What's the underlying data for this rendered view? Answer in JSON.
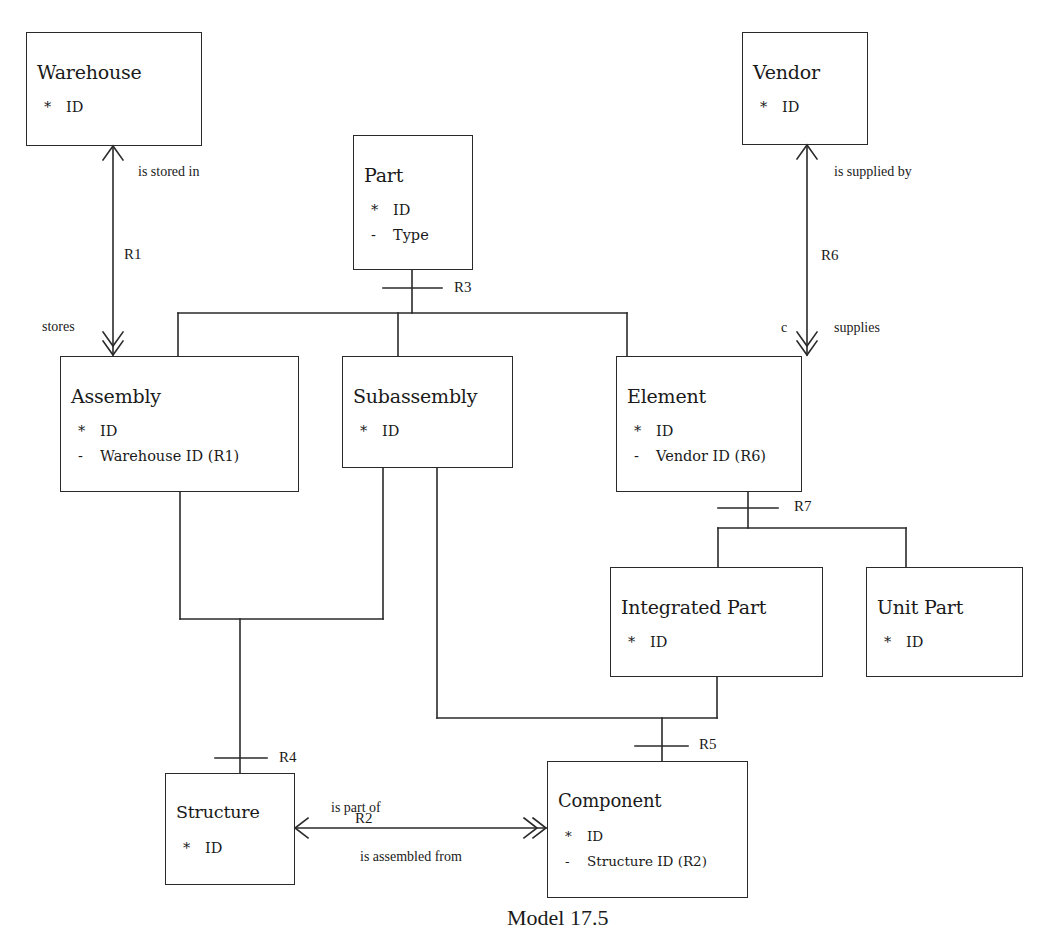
{
  "diagram": {
    "caption": "Model 17.5",
    "entities": {
      "warehouse": {
        "name": "Warehouse",
        "attrs": [
          {
            "mark": "*",
            "text": "ID"
          }
        ]
      },
      "part": {
        "name": "Part",
        "attrs": [
          {
            "mark": "*",
            "text": "ID"
          },
          {
            "mark": "-",
            "text": "Type"
          }
        ]
      },
      "vendor": {
        "name": "Vendor",
        "attrs": [
          {
            "mark": "*",
            "text": "ID"
          }
        ]
      },
      "assembly": {
        "name": "Assembly",
        "attrs": [
          {
            "mark": "*",
            "text": "ID"
          },
          {
            "mark": "-",
            "text": "Warehouse ID (R1)"
          }
        ]
      },
      "subassembly": {
        "name": "Subassembly",
        "attrs": [
          {
            "mark": "*",
            "text": "ID"
          }
        ]
      },
      "element": {
        "name": "Element",
        "attrs": [
          {
            "mark": "*",
            "text": "ID"
          },
          {
            "mark": "-",
            "text": "Vendor ID (R6)"
          }
        ]
      },
      "integrated_part": {
        "name": "Integrated Part",
        "attrs": [
          {
            "mark": "*",
            "text": "ID"
          }
        ]
      },
      "unit_part": {
        "name": "Unit Part",
        "attrs": [
          {
            "mark": "*",
            "text": "ID"
          }
        ]
      },
      "structure": {
        "name": "Structure",
        "attrs": [
          {
            "mark": "*",
            "text": "ID"
          }
        ]
      },
      "component": {
        "name": "Component",
        "attrs": [
          {
            "mark": "*",
            "text": "ID"
          },
          {
            "mark": "-",
            "text": "Structure ID (R2)"
          }
        ]
      }
    },
    "relationships": {
      "r1": {
        "id": "R1",
        "forward": "is stored in",
        "reverse": "stores"
      },
      "r2": {
        "id": "R2",
        "forward": "is part of",
        "reverse": "is assembled from"
      },
      "r3": {
        "id": "R3"
      },
      "r4": {
        "id": "R4"
      },
      "r5": {
        "id": "R5"
      },
      "r6": {
        "id": "R6",
        "forward": "is supplied by",
        "reverse": "supplies",
        "conditionality": "c"
      },
      "r7": {
        "id": "R7"
      }
    }
  }
}
